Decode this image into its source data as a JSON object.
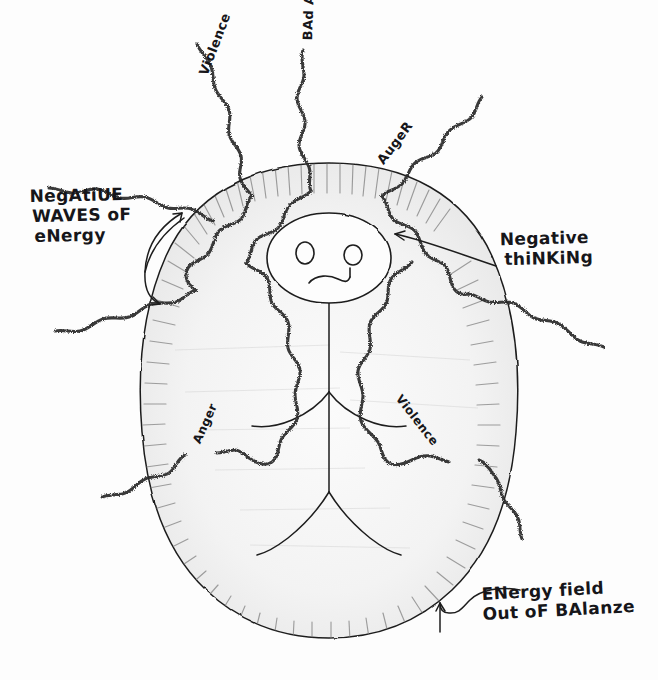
{
  "diagram": {
    "kind": "hand-drawn-sketch",
    "background_color": "#fdfdfd",
    "ink_color": "#1a1a1a",
    "aura_fill_color": "#efefef",
    "aura_shade_color": "#9a9a9a"
  },
  "callouts": [
    {
      "id": "negative-waves",
      "line1": "NegAtiUE",
      "line2": "WAVES oF",
      "line3": "eNergy",
      "arrow": "double-headed-curve"
    },
    {
      "id": "negative-thinking",
      "line1": "Negative",
      "line2": "thiNKiNg",
      "arrow": "long-curve-left"
    },
    {
      "id": "energy-field",
      "line1": "ENergy field",
      "line2": "Out oF BAlanze",
      "arrow": "hook-up-left"
    }
  ],
  "ray_labels": [
    {
      "id": "violence-top",
      "text": "Violence"
    },
    {
      "id": "bad-attitude",
      "text": "BAd Attitude"
    },
    {
      "id": "anger-top",
      "text": "AugeR"
    },
    {
      "id": "anger-left",
      "text": "Anger"
    },
    {
      "id": "violence-right",
      "text": "Violence"
    }
  ],
  "figure": {
    "head": "oval-head",
    "eyes": 2,
    "mouth": "frown",
    "body": "torso-with-arms-and-legs"
  }
}
